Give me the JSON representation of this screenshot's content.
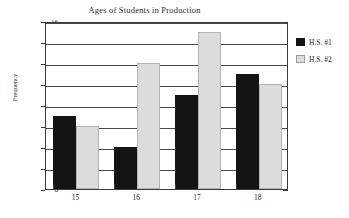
{
  "chart_data": {
    "type": "bar",
    "title": "Ages of Students in Production",
    "xlabel": "",
    "ylabel": "Frequency",
    "categories": [
      "15",
      "16",
      "17",
      "18"
    ],
    "series": [
      {
        "name": "H.S. #1",
        "color": "#141414",
        "values": [
          7,
          4,
          9,
          11
        ]
      },
      {
        "name": "H.S. #2",
        "color": "#dcdcdc",
        "values": [
          6,
          12,
          15,
          10
        ]
      }
    ],
    "ylim": [
      0,
      16
    ],
    "ytick_step": 2,
    "yticks": [
      0,
      2,
      4,
      6,
      8,
      10,
      12,
      14,
      16
    ],
    "grid": true,
    "legend_position": "right"
  }
}
